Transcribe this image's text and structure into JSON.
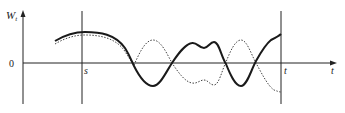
{
  "figure": {
    "y_axis_label": "W",
    "y_axis_label_sub": "t",
    "origin_label": "0",
    "s_label": "s",
    "t_label": "t",
    "x_axis_label": "t"
  },
  "colors": {
    "axis": "#222222",
    "solid_path": "#1a1a1a",
    "dotted_path": "#333333"
  },
  "paths": {
    "solid": "M55,41 C65,35 75,32 85,32 C100,32 115,34 125,48 C130,56 132,62 134,66 C140,78 146,86 153,86 C160,86 166,72 172,63 C178,54 185,44 192,43 C197,42 199,48 204,48 C208,48 210,42 214,42 C219,42 221,56 226,64 C230,74 235,86 241,86 C247,86 251,70 256,61 C261,52 266,44 271,40 C275,38 279,36 281,34",
    "dotted": "M55,44 C65,38 75,35 85,35 C100,35 115,38 124,50 C128,56 130,60 134,65 C139,54 145,40 153,40 C161,40 167,54 172,63 C178,72 185,82 192,83 C197,84 200,80 204,80 C208,80 210,85 214,85 C219,85 222,70 226,62 C230,52 235,40 241,40 C247,40 251,54 256,63 C262,74 268,86 274,90 C277,91 279,92 281,92"
  }
}
